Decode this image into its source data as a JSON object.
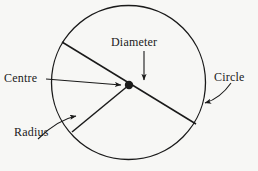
{
  "figure": {
    "background_color": "#f7f7f5",
    "stroke_color": "#1a1a1a",
    "text_color": "#1a1a1a",
    "width": 258,
    "height": 171
  },
  "labels": {
    "diameter": "Diameter",
    "centre": "Centre",
    "circle": "Circle",
    "radius": "Radius"
  },
  "geometry": {
    "circle": {
      "cx": 128.5,
      "cy": 82.5,
      "r": 77
    },
    "centre_point": {
      "cx": 129,
      "cy": 85,
      "r": 4.2
    },
    "diameter_line": {
      "x1": 62,
      "y1": 42,
      "x2": 196,
      "y2": 124
    },
    "radius_line": {
      "x1": 129,
      "y1": 85,
      "x2": 72,
      "y2": 132
    },
    "centre_pointer": {
      "x1": 46,
      "y1": 79,
      "x2": 124,
      "y2": 85
    },
    "diameter_pointer": {
      "x1": 144,
      "y1": 51,
      "x2": 144,
      "y2": 83
    },
    "circle_pointer": {
      "x1": 230,
      "y1": 84,
      "x2": 203,
      "y2": 104
    },
    "radius_pointer": {
      "x1": 40,
      "y1": 137,
      "x2": 80,
      "y2": 116
    }
  }
}
